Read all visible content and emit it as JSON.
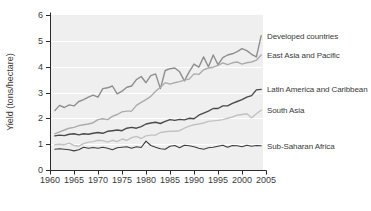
{
  "chart_data": {
    "type": "line",
    "ylabel": "Yield (tons/hectare)",
    "xlabel": "",
    "xlim": [
      1960,
      2005
    ],
    "ylim": [
      0,
      6
    ],
    "x_ticks": [
      1960,
      1965,
      1970,
      1975,
      1980,
      1985,
      1990,
      1995,
      2000,
      2005
    ],
    "y_ticks": [
      0,
      1,
      2,
      3,
      4,
      5,
      6
    ],
    "grid": "horizontal-white",
    "plot_bg": "#efefef",
    "axis_color": "#2b2b2b",
    "text_color": "#3a3a3a",
    "label_position": "right-of-line-end",
    "x_years": [
      1961,
      1962,
      1963,
      1964,
      1965,
      1966,
      1967,
      1968,
      1969,
      1970,
      1971,
      1972,
      1973,
      1974,
      1975,
      1976,
      1977,
      1978,
      1979,
      1980,
      1981,
      1982,
      1983,
      1984,
      1985,
      1986,
      1987,
      1988,
      1989,
      1990,
      1991,
      1992,
      1993,
      1994,
      1995,
      1996,
      1997,
      1998,
      1999,
      2000,
      2001,
      2002,
      2003,
      2004
    ],
    "series": [
      {
        "name": "Developed countries",
        "color": "#8e8e8e",
        "width": 1.4,
        "values": [
          2.3,
          2.5,
          2.42,
          2.52,
          2.48,
          2.65,
          2.72,
          2.82,
          2.9,
          2.82,
          3.15,
          3.18,
          3.25,
          2.95,
          3.05,
          3.2,
          3.25,
          3.5,
          3.62,
          3.38,
          3.65,
          3.72,
          3.15,
          3.85,
          3.92,
          3.95,
          3.8,
          3.45,
          3.8,
          4.1,
          3.98,
          4.38,
          4.0,
          4.45,
          4.08,
          4.35,
          4.45,
          4.5,
          4.58,
          4.7,
          4.62,
          4.48,
          4.38,
          5.2
        ]
      },
      {
        "name": "East Asia and Pacific",
        "color": "#ababab",
        "width": 1.4,
        "values": [
          1.4,
          1.48,
          1.55,
          1.62,
          1.65,
          1.72,
          1.75,
          1.78,
          1.83,
          1.95,
          1.98,
          1.95,
          2.08,
          2.15,
          2.25,
          2.28,
          2.28,
          2.5,
          2.62,
          2.72,
          2.85,
          3.05,
          3.2,
          3.38,
          3.32,
          3.38,
          3.42,
          3.48,
          3.52,
          3.72,
          3.7,
          3.88,
          3.95,
          3.98,
          4.05,
          4.15,
          4.08,
          4.15,
          4.18,
          4.1,
          4.15,
          4.18,
          4.25,
          4.45
        ]
      },
      {
        "name": "Latin America and Caribbean",
        "color": "#4a4a4a",
        "width": 1.4,
        "values": [
          1.32,
          1.35,
          1.33,
          1.38,
          1.4,
          1.36,
          1.4,
          1.38,
          1.42,
          1.45,
          1.42,
          1.5,
          1.52,
          1.55,
          1.52,
          1.62,
          1.65,
          1.62,
          1.68,
          1.78,
          1.82,
          1.85,
          1.8,
          1.88,
          1.95,
          1.92,
          1.96,
          1.94,
          2.0,
          1.98,
          2.12,
          2.2,
          2.28,
          2.38,
          2.38,
          2.48,
          2.48,
          2.58,
          2.65,
          2.72,
          2.82,
          2.88,
          3.1,
          3.12
        ]
      },
      {
        "name": "South Asia",
        "color": "#c2c2c2",
        "width": 1.4,
        "values": [
          0.98,
          1.0,
          0.98,
          1.04,
          0.95,
          0.92,
          1.02,
          1.08,
          1.1,
          1.15,
          1.14,
          1.08,
          1.15,
          1.1,
          1.2,
          1.15,
          1.25,
          1.3,
          1.22,
          1.32,
          1.35,
          1.35,
          1.45,
          1.48,
          1.5,
          1.5,
          1.52,
          1.62,
          1.7,
          1.75,
          1.78,
          1.82,
          1.88,
          1.9,
          1.92,
          1.95,
          2.0,
          2.05,
          2.12,
          2.15,
          2.18,
          2.02,
          2.18,
          2.32
        ]
      },
      {
        "name": "Sub-Saharan Africa",
        "color": "#3c3c3c",
        "width": 1.1,
        "values": [
          0.8,
          0.82,
          0.8,
          0.78,
          0.74,
          0.78,
          0.88,
          0.84,
          0.87,
          0.84,
          0.88,
          0.84,
          0.78,
          0.86,
          0.88,
          0.9,
          0.84,
          0.9,
          0.87,
          1.12,
          0.95,
          0.88,
          0.82,
          0.8,
          0.92,
          0.95,
          0.86,
          0.96,
          0.94,
          0.9,
          0.84,
          0.8,
          0.86,
          0.88,
          0.92,
          0.96,
          0.88,
          0.95,
          0.94,
          0.9,
          0.96,
          0.92,
          0.95,
          0.94
        ]
      }
    ]
  }
}
